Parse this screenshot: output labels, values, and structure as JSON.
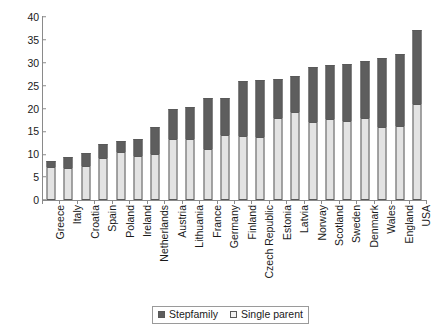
{
  "chart_data": {
    "type": "bar",
    "subtype": "stacked-column",
    "title": "",
    "subtitle": "",
    "xlabel": "",
    "ylabel": "",
    "ylim": [
      0,
      40
    ],
    "ytick_step": 5,
    "yticks": [
      40,
      35,
      30,
      25,
      20,
      15,
      10,
      5,
      0
    ],
    "grid": false,
    "legend_position": "bottom-center",
    "categories": [
      "Greece",
      "Italy",
      "Croatia",
      "Spain",
      "Poland",
      "Ireland",
      "Netherlands",
      "Austria",
      "Lithuania",
      "France",
      "Germany",
      "Finland",
      "Czech Republic",
      "Estonia",
      "Latvia",
      "Norway",
      "Scotland",
      "Sweden",
      "Denmark",
      "Wales",
      "England",
      "USA"
    ],
    "series": [
      {
        "name": "Single parent",
        "color": "#e3e3e3",
        "values": [
          7.2,
          7.1,
          7.4,
          9.2,
          10.4,
          9.7,
          10.0,
          13.4,
          13.4,
          11.2,
          14.2,
          14.0,
          13.7,
          18.0,
          19.2,
          17.0,
          17.6,
          17.2,
          18.0,
          16.0,
          16.2,
          21.0
        ]
      },
      {
        "name": "Stepfamily",
        "color": "#5e5e5e",
        "values": [
          1.3,
          2.3,
          2.8,
          3.0,
          2.6,
          3.7,
          6.0,
          6.4,
          7.0,
          11.0,
          8.0,
          12.0,
          12.5,
          8.5,
          8.0,
          12.0,
          12.0,
          12.6,
          12.4,
          15.0,
          15.8,
          16.2
        ]
      }
    ],
    "totals": [
      8.5,
      9.4,
      10.2,
      12.2,
      13.0,
      13.4,
      16.0,
      19.8,
      20.4,
      22.2,
      22.2,
      26.0,
      26.2,
      26.5,
      27.2,
      29.0,
      29.6,
      29.8,
      30.4,
      31.0,
      32.0,
      37.2
    ],
    "legend": [
      {
        "label": "Stepfamily",
        "swatch": "dark-square-swatch"
      },
      {
        "label": "Single parent",
        "swatch": "light-square-swatch"
      }
    ]
  }
}
